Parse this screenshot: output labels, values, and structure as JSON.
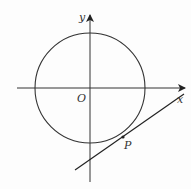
{
  "diagram": {
    "type": "coordinate-geometry",
    "labels": {
      "x_axis": "x",
      "y_axis": "y",
      "origin": "O",
      "point": "P"
    },
    "colors": {
      "stroke": "#333333",
      "background": "#fdfdfd"
    },
    "geometry": {
      "origin_px": [
        90,
        88
      ],
      "circle_radius_px": 55,
      "x_axis_px": {
        "from": [
          17,
          88
        ],
        "to": [
          186,
          88
        ]
      },
      "y_axis_px": {
        "from": [
          90,
          182
        ],
        "to": [
          90,
          14
        ]
      },
      "tangent_line_px": {
        "from": [
          75,
          170
        ],
        "to": [
          184,
          94
        ]
      },
      "point_P_px": [
        123,
        137
      ]
    }
  }
}
